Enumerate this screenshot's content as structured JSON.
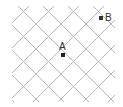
{
  "diagram": {
    "type": "diagonal-grid",
    "line_color": "#b8b8b8",
    "point_color": "#222222",
    "points": [
      {
        "label": "A",
        "x": 63,
        "y": 55
      },
      {
        "label": "B",
        "x": 101,
        "y": 18
      }
    ]
  }
}
